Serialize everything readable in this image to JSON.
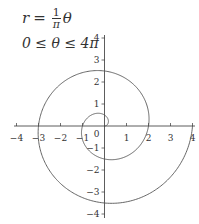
{
  "chart_data": {
    "type": "line",
    "subtype": "polar-parametric",
    "title": "",
    "equation": {
      "lhs": "r",
      "equals": "=",
      "frac_num": "1",
      "frac_den": "π",
      "rhs_var": "θ",
      "domain": "0 ≤ θ ≤ 4π"
    },
    "function": "r = θ/π",
    "theta_range": [
      0,
      12.566
    ],
    "xlabel": "",
    "ylabel": "",
    "xlim": [
      -4,
      4
    ],
    "ylim": [
      -4,
      4
    ],
    "xticks": [
      "−4",
      "−3",
      "−2",
      "−1",
      "0",
      "1",
      "2",
      "3",
      "4"
    ],
    "yticks": [
      "4",
      "3",
      "2",
      "1",
      "−1",
      "−2",
      "−3",
      "−4"
    ],
    "grid": false,
    "legend": "none",
    "line_color": "#555555",
    "axis_color": "#333333"
  }
}
